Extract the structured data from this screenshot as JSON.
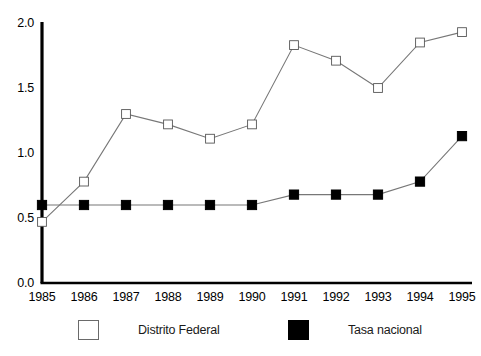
{
  "figure": {
    "background_color": "#ffffff",
    "ink_color": "#000000"
  },
  "axis": {
    "y_ticks": [
      "2.0",
      "1.5",
      "1.0",
      "0.5",
      "0.0"
    ],
    "y_tick_values": [
      2.0,
      1.5,
      1.0,
      0.5,
      0.0
    ],
    "x_ticks": [
      "1985",
      "1986",
      "1987",
      "1988",
      "1989",
      "1990",
      "1991",
      "1992",
      "1993",
      "1994",
      "1995"
    ]
  },
  "legend": {
    "items": [
      {
        "label": "Distrito Federal",
        "marker": "open-square",
        "color": "#ffffff",
        "edge_color": "#6a6a6a"
      },
      {
        "label": "Tasa nacional",
        "marker": "filled-square",
        "color": "#000000",
        "edge_color": "#000000"
      }
    ]
  },
  "chart_data": {
    "type": "line",
    "title": "",
    "xlabel": "",
    "ylabel": "",
    "x": [
      1985,
      1986,
      1987,
      1988,
      1989,
      1990,
      1991,
      1992,
      1993,
      1994,
      1995
    ],
    "categories": [
      "1985",
      "1986",
      "1987",
      "1988",
      "1989",
      "1990",
      "1991",
      "1992",
      "1993",
      "1994",
      "1995"
    ],
    "series": [
      {
        "name": "Distrito Federal",
        "marker": "open-square",
        "color": "#ffffff",
        "edge_color": "#555555",
        "line_color": "#777777",
        "values": [
          0.47,
          0.78,
          1.3,
          1.22,
          1.11,
          1.22,
          1.83,
          1.71,
          1.5,
          1.85,
          1.93
        ]
      },
      {
        "name": "Tasa nacional",
        "marker": "filled-square",
        "color": "#000000",
        "edge_color": "#000000",
        "line_color": "#777777",
        "values": [
          0.6,
          0.6,
          0.6,
          0.6,
          0.6,
          0.6,
          0.68,
          0.68,
          0.68,
          0.78,
          1.13
        ]
      }
    ],
    "ylim": [
      0.0,
      2.0
    ],
    "xlim": [
      1985,
      1995
    ],
    "grid": false,
    "legend_position": "bottom"
  }
}
